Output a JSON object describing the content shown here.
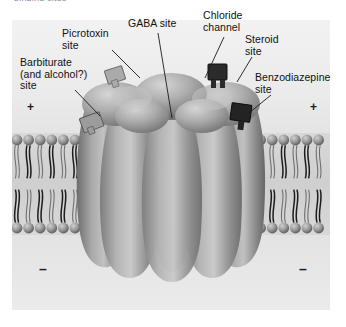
{
  "figure": {
    "cropped_caption_top": "binding sites",
    "panel_background_color": "#e9e9e9",
    "page_background_color": "#ffffff"
  },
  "labels": [
    {
      "id": "picrotoxin",
      "text": "Picrotoxin\nsite",
      "x": 62,
      "y": 28
    },
    {
      "id": "gaba",
      "text": "GABA site",
      "x": 128,
      "y": 18
    },
    {
      "id": "chloride",
      "text": "Chloride\nchannel",
      "x": 203,
      "y": 10
    },
    {
      "id": "steroid",
      "text": "Steroid\nsite",
      "x": 245,
      "y": 34
    },
    {
      "id": "barbiturate",
      "text": "Barbiturate\n(and alcohol?)\nsite",
      "x": 20,
      "y": 57
    },
    {
      "id": "benzodiazepine",
      "text": "Benzodiazepine\nsite",
      "x": 255,
      "y": 72
    }
  ],
  "charges": [
    {
      "id": "charge-left-plus",
      "sign": "+",
      "x": 27,
      "y": 101
    },
    {
      "id": "charge-right-plus",
      "sign": "+",
      "x": 310,
      "y": 101
    },
    {
      "id": "charge-left-minus",
      "sign": "–",
      "x": 39,
      "y": 262
    },
    {
      "id": "charge-right-minus",
      "sign": "–",
      "x": 299,
      "y": 262
    }
  ],
  "structure": {
    "membrane_label": "lipid bilayer membrane",
    "receptor_label": "GABA-A receptor pentamer",
    "pore_label": "chloride channel pore",
    "subunit_count": 5,
    "binding_markers": [
      {
        "id": "marker-barbiturate",
        "tone": "light"
      },
      {
        "id": "marker-picrotoxin",
        "tone": "light"
      },
      {
        "id": "marker-steroid",
        "tone": "dark"
      },
      {
        "id": "marker-benzodiazepine",
        "tone": "dark"
      }
    ]
  }
}
